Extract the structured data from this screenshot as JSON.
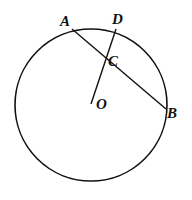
{
  "diagram": {
    "type": "circle-chord-geometry",
    "circle": {
      "center": [
        91,
        105
      ],
      "radius": 76
    },
    "points": {
      "A": {
        "label": "A",
        "x": 72,
        "y": 29
      },
      "B": {
        "label": "B",
        "x": 166,
        "y": 109
      },
      "C": {
        "label": "C",
        "x": 108,
        "y": 58
      },
      "D": {
        "label": "D",
        "x": 116,
        "y": 29
      },
      "O": {
        "label": "O",
        "x": 92,
        "y": 104
      }
    },
    "segments": [
      {
        "from": "A",
        "to": "B"
      },
      {
        "from": "O",
        "to": "D"
      }
    ],
    "colors": {
      "stroke": "#111111",
      "background": "#ffffff"
    }
  }
}
